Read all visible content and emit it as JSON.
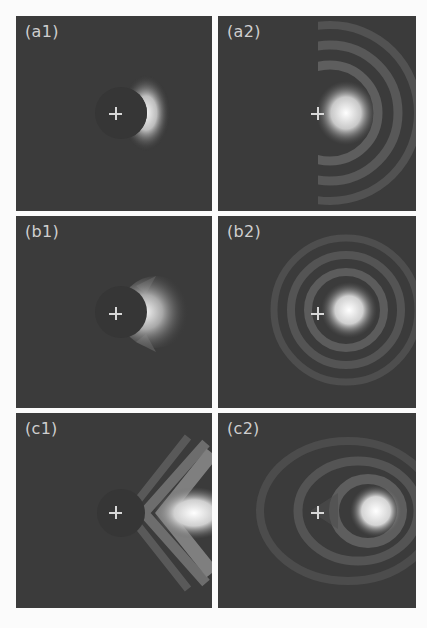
{
  "figure": {
    "background": "#fbfbfb",
    "panel_background": "#3b3b3b",
    "label_color": "#cfcfcf",
    "panels": [
      {
        "id": "a1",
        "label": "(a1)",
        "row": "a",
        "col": 1,
        "pattern": "crescent-right-of-dark-disk",
        "marker": "cross"
      },
      {
        "id": "a2",
        "label": "(a2)",
        "row": "a",
        "col": 2,
        "pattern": "bright-spot-with-concentric-rings",
        "marker": "cross"
      },
      {
        "id": "b1",
        "label": "(b1)",
        "row": "b",
        "col": 1,
        "pattern": "bright-lobe-right-of-dark-disk",
        "marker": "cross"
      },
      {
        "id": "b2",
        "label": "(b2)",
        "row": "b",
        "col": 2,
        "pattern": "bright-spot-with-concentric-rings",
        "marker": "cross"
      },
      {
        "id": "c1",
        "label": "(c1)",
        "row": "c",
        "col": 1,
        "pattern": "chevron-fringes-with-bright-spot",
        "marker": "cross"
      },
      {
        "id": "c2",
        "label": "(c2)",
        "row": "c",
        "col": 2,
        "pattern": "bright-spot-with-concentric-rings",
        "marker": "cross"
      }
    ]
  }
}
